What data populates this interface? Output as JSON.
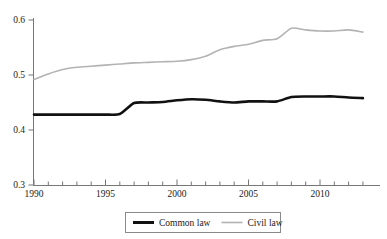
{
  "chart_data": {
    "type": "line",
    "title": "",
    "xlabel": "",
    "ylabel": "",
    "xlim": [
      1990,
      2014
    ],
    "ylim": [
      0.3,
      0.6
    ],
    "grid": false,
    "legend_position": "bottom",
    "x_ticks_major": [
      "1990",
      "1995",
      "2000",
      "2005",
      "2010"
    ],
    "x_ticks_major_values": [
      1990,
      1995,
      2000,
      2005,
      2010
    ],
    "x_ticks_minor_values": [
      1991,
      1992,
      1993,
      1994,
      1996,
      1997,
      1998,
      1999,
      2001,
      2002,
      2003,
      2004,
      2006,
      2007,
      2008,
      2009,
      2011,
      2012,
      2013
    ],
    "y_ticks": [
      "0.3",
      "0.4",
      "0.5",
      "0.6"
    ],
    "y_tick_values": [
      0.3,
      0.4,
      0.5,
      0.6
    ],
    "x": [
      1990,
      1991,
      1992,
      1993,
      1994,
      1995,
      1996,
      1997,
      1998,
      1999,
      2000,
      2001,
      2002,
      2003,
      2004,
      2005,
      2006,
      2007,
      2008,
      2009,
      2010,
      2011,
      2012,
      2013
    ],
    "series": [
      {
        "name": "Common law",
        "color": "#111111",
        "width": 2.6,
        "values": [
          0.428,
          0.428,
          0.428,
          0.428,
          0.428,
          0.428,
          0.429,
          0.449,
          0.45,
          0.451,
          0.454,
          0.456,
          0.455,
          0.452,
          0.45,
          0.452,
          0.452,
          0.452,
          0.46,
          0.461,
          0.461,
          0.461,
          0.459,
          0.458
        ]
      },
      {
        "name": "Civil law",
        "color": "#b3b3b3",
        "width": 1.6,
        "values": [
          0.492,
          0.502,
          0.51,
          0.514,
          0.516,
          0.518,
          0.52,
          0.522,
          0.523,
          0.524,
          0.525,
          0.528,
          0.534,
          0.546,
          0.552,
          0.556,
          0.563,
          0.566,
          0.585,
          0.582,
          0.58,
          0.58,
          0.582,
          0.578
        ]
      }
    ]
  },
  "legend": {
    "items": [
      {
        "label": "Common law",
        "color": "#111111",
        "width": 3.0
      },
      {
        "label": "Civil law",
        "color": "#b3b3b3",
        "width": 1.6
      }
    ]
  },
  "axes": {
    "y_labels": [
      "0.6",
      "0.5",
      "0.4",
      "0.3"
    ],
    "x_labels": [
      "1990",
      "1995",
      "2000",
      "2005",
      "2010"
    ]
  }
}
